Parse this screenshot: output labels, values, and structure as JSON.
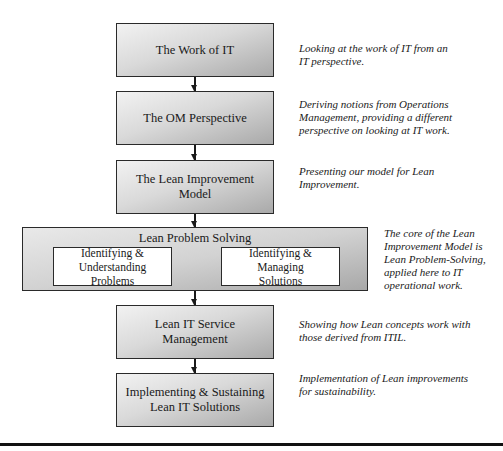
{
  "diagram": {
    "type": "vertical-flowchart",
    "steps": [
      {
        "label": "The Work of IT",
        "description": "Looking at the work of IT from an IT perspective."
      },
      {
        "label": "The OM Perspective",
        "description": "Deriving notions from Operations Management, providing a different perspective on looking at IT work."
      },
      {
        "label": "The Lean Improvement Model",
        "description": "Presenting our model for Lean Improvement."
      },
      {
        "label": "Lean Problem Solving",
        "substeps": [
          {
            "label": "Identifying & Understanding Problems"
          },
          {
            "label": "Identifying & Managing Solutions"
          }
        ],
        "description": "The core of the Lean Improvement Model is Lean Problem-Solving, applied here to IT operational work."
      },
      {
        "label": "Lean IT Service Management",
        "description": "Showing how Lean concepts work with those derived from ITIL."
      },
      {
        "label": "Implementing & Sustaining Lean IT Solutions",
        "description": "Implementation of Lean improvements for sustainability."
      }
    ],
    "connections": [
      [
        "The Work of IT",
        "The OM Perspective"
      ],
      [
        "The OM Perspective",
        "The Lean Improvement Model"
      ],
      [
        "The Lean Improvement Model",
        "Lean Problem Solving"
      ],
      [
        "Lean Problem Solving",
        "Lean IT Service Management"
      ],
      [
        "Lean IT Service Management",
        "Implementing & Sustaining Lean IT Solutions"
      ]
    ],
    "colors": {
      "box_fill_light": "#f2f2f2",
      "box_fill_dark": "#a9a9a9",
      "border": "#2a2a2a",
      "inner_fill": "#ffffff"
    }
  },
  "desc_lines": {
    "d0": [
      "Looking at the work of IT from an",
      "IT perspective."
    ],
    "d1": [
      "Deriving notions from Operations",
      "Management, providing a different",
      "perspective on looking at IT work."
    ],
    "d2": [
      "Presenting our model for Lean",
      "Improvement."
    ],
    "d3": [
      "The core of the Lean",
      "Improvement Model is",
      "Lean Problem-Solving,",
      "applied here to IT",
      "operational work."
    ],
    "d4": [
      "Showing how Lean concepts work with",
      "those derived from ITIL."
    ],
    "d5": [
      "Implementation of Lean improvements",
      "for sustainability."
    ]
  },
  "box_lines": {
    "b2": [
      "The Lean Improvement",
      "Model"
    ],
    "b3a": [
      "Identifying &",
      "Understanding Problems"
    ],
    "b3b": [
      "Identifying & Managing",
      "Solutions"
    ],
    "b5": [
      "Implementing & Sustaining",
      "Lean IT Solutions"
    ]
  }
}
